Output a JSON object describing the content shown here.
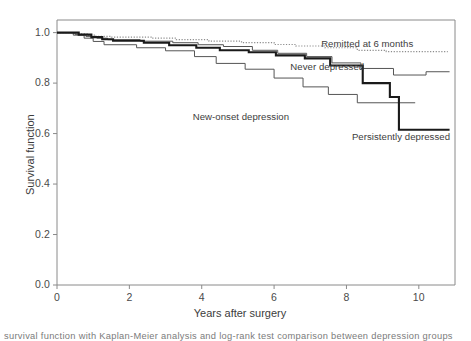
{
  "figure": {
    "caption_fragment": "survival function with Kaplan-Meier analysis and log-rank test comparison between depression groups"
  },
  "chart_data": {
    "type": "line",
    "title": "",
    "xlabel": "Years after surgery",
    "ylabel": "Survival function",
    "xlim": [
      0,
      11
    ],
    "ylim": [
      0,
      1.05
    ],
    "xticks": [
      0,
      2,
      4,
      6,
      8,
      10
    ],
    "xticklabels": [
      "0",
      "2",
      "4",
      "6",
      "8",
      "10"
    ],
    "yticks": [
      0.0,
      0.2,
      0.4,
      0.6,
      0.8,
      1.0
    ],
    "yticklabels": [
      "0.0",
      "0.2",
      "0.4",
      "0.6",
      "0.8",
      "1.0"
    ],
    "grid": false,
    "legend": "inline-annotations",
    "step_style": "post",
    "series": [
      {
        "name": "Remitted at 6 months",
        "style": "dotted",
        "color": "#8c8c8c",
        "label_x": 7.3,
        "label_y": 0.955,
        "points": [
          [
            0.0,
            1.0
          ],
          [
            0.55,
            1.0
          ],
          [
            0.55,
            0.995
          ],
          [
            0.85,
            0.995
          ],
          [
            0.85,
            0.99
          ],
          [
            1.05,
            0.99
          ],
          [
            1.05,
            0.985
          ],
          [
            1.5,
            0.985
          ],
          [
            1.5,
            0.982
          ],
          [
            2.6,
            0.982
          ],
          [
            2.6,
            0.978
          ],
          [
            3.3,
            0.978
          ],
          [
            3.3,
            0.972
          ],
          [
            4.2,
            0.972
          ],
          [
            4.2,
            0.966
          ],
          [
            5.1,
            0.966
          ],
          [
            5.1,
            0.96
          ],
          [
            6.0,
            0.96
          ],
          [
            6.0,
            0.953
          ],
          [
            6.6,
            0.953
          ],
          [
            6.6,
            0.947
          ],
          [
            7.4,
            0.947
          ],
          [
            7.4,
            0.94
          ],
          [
            8.3,
            0.94
          ],
          [
            8.3,
            0.93
          ],
          [
            9.1,
            0.93
          ],
          [
            9.1,
            0.925
          ],
          [
            10.8,
            0.925
          ]
        ]
      },
      {
        "name": "Never depressed",
        "style": "thin-solid",
        "color": "#555555",
        "label_x": 6.45,
        "label_y": 0.862,
        "points": [
          [
            0.0,
            1.0
          ],
          [
            0.5,
            1.0
          ],
          [
            0.5,
            0.993
          ],
          [
            0.8,
            0.993
          ],
          [
            0.8,
            0.985
          ],
          [
            1.1,
            0.985
          ],
          [
            1.1,
            0.978
          ],
          [
            1.4,
            0.978
          ],
          [
            1.4,
            0.972
          ],
          [
            2.3,
            0.972
          ],
          [
            2.3,
            0.966
          ],
          [
            3.2,
            0.966
          ],
          [
            3.2,
            0.96
          ],
          [
            3.9,
            0.96
          ],
          [
            3.9,
            0.952
          ],
          [
            4.6,
            0.952
          ],
          [
            4.6,
            0.945
          ],
          [
            5.4,
            0.945
          ],
          [
            5.4,
            0.93
          ],
          [
            6.1,
            0.93
          ],
          [
            6.1,
            0.918
          ],
          [
            6.9,
            0.918
          ],
          [
            6.9,
            0.905
          ],
          [
            7.6,
            0.905
          ],
          [
            7.6,
            0.88
          ],
          [
            8.4,
            0.88
          ],
          [
            8.4,
            0.858
          ],
          [
            9.3,
            0.858
          ],
          [
            9.3,
            0.832
          ],
          [
            10.2,
            0.832
          ],
          [
            10.2,
            0.845
          ],
          [
            10.85,
            0.845
          ]
        ]
      },
      {
        "name": "New-onset depression",
        "style": "thin-solid",
        "color": "#555555",
        "label_x": 3.75,
        "label_y": 0.665,
        "points": [
          [
            0.0,
            1.0
          ],
          [
            0.45,
            1.0
          ],
          [
            0.45,
            0.99
          ],
          [
            0.75,
            0.99
          ],
          [
            0.75,
            0.978
          ],
          [
            1.0,
            0.978
          ],
          [
            1.0,
            0.965
          ],
          [
            1.3,
            0.965
          ],
          [
            1.3,
            0.952
          ],
          [
            2.2,
            0.952
          ],
          [
            2.2,
            0.94
          ],
          [
            3.0,
            0.94
          ],
          [
            3.0,
            0.928
          ],
          [
            3.8,
            0.928
          ],
          [
            3.8,
            0.905
          ],
          [
            4.4,
            0.905
          ],
          [
            4.4,
            0.878
          ],
          [
            5.2,
            0.878
          ],
          [
            5.2,
            0.855
          ],
          [
            6.0,
            0.855
          ],
          [
            6.0,
            0.82
          ],
          [
            6.8,
            0.82
          ],
          [
            6.8,
            0.785
          ],
          [
            7.5,
            0.785
          ],
          [
            7.5,
            0.755
          ],
          [
            8.3,
            0.755
          ],
          [
            8.3,
            0.722
          ],
          [
            9.9,
            0.722
          ]
        ]
      },
      {
        "name": "Persistently depressed",
        "style": "thick-solid",
        "color": "#1a1a1a",
        "label_x": 8.15,
        "label_y": 0.585,
        "points": [
          [
            0.0,
            1.0
          ],
          [
            0.6,
            1.0
          ],
          [
            0.6,
            0.992
          ],
          [
            0.95,
            0.992
          ],
          [
            0.95,
            0.982
          ],
          [
            1.25,
            0.982
          ],
          [
            1.25,
            0.974
          ],
          [
            1.55,
            0.974
          ],
          [
            1.55,
            0.968
          ],
          [
            2.4,
            0.968
          ],
          [
            2.4,
            0.96
          ],
          [
            3.1,
            0.96
          ],
          [
            3.1,
            0.95
          ],
          [
            3.85,
            0.95
          ],
          [
            3.85,
            0.94
          ],
          [
            4.5,
            0.94
          ],
          [
            4.5,
            0.93
          ],
          [
            5.3,
            0.93
          ],
          [
            5.3,
            0.922
          ],
          [
            6.05,
            0.922
          ],
          [
            6.05,
            0.91
          ],
          [
            6.85,
            0.91
          ],
          [
            6.85,
            0.898
          ],
          [
            7.55,
            0.898
          ],
          [
            7.55,
            0.87
          ],
          [
            8.45,
            0.87
          ],
          [
            8.45,
            0.8
          ],
          [
            9.2,
            0.8
          ],
          [
            9.2,
            0.745
          ],
          [
            9.45,
            0.745
          ],
          [
            9.45,
            0.615
          ],
          [
            10.85,
            0.615
          ]
        ]
      }
    ]
  }
}
